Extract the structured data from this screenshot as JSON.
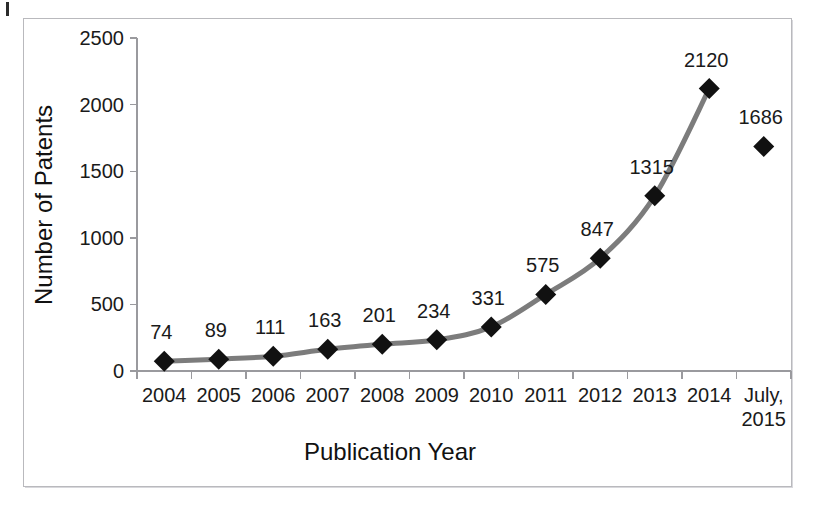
{
  "figure": {
    "background_color": "#ffffff",
    "frame_color": "#b9b9bd",
    "scan_mark_label": "scan-artifact"
  },
  "chart_data": {
    "type": "line",
    "title": "",
    "xlabel": "Publication Year",
    "ylabel": "Number of Patents",
    "categories": [
      "2004",
      "2005",
      "2006",
      "2007",
      "2008",
      "2009",
      "2010",
      "2011",
      "2012",
      "2013",
      "2014",
      "July,\n2015"
    ],
    "category_labels_display": [
      "2004",
      "2005",
      "2006",
      "2007",
      "2008",
      "2009",
      "2010",
      "2011",
      "2012",
      "2013",
      "2014",
      "July, 2015"
    ],
    "last_category_line1": "July,",
    "last_category_line2": "2015",
    "values": [
      74,
      89,
      111,
      163,
      201,
      234,
      331,
      575,
      847,
      1315,
      2120,
      1686
    ],
    "point_labels": [
      "74",
      "89",
      "111",
      "163",
      "201",
      "234",
      "331",
      "575",
      "847",
      "1315",
      "2120",
      "1686"
    ],
    "connected_points": 11,
    "disconnected_point_index": 11,
    "ylim": [
      0,
      2500
    ],
    "yticks": [
      0,
      500,
      1000,
      1500,
      2000,
      2500
    ],
    "ytick_labels": [
      "0",
      "500",
      "1000",
      "1500",
      "2000",
      "2500"
    ],
    "grid": false,
    "legend": false,
    "legend_position": "none",
    "line_color": "#7c7c7c",
    "marker_color": "#111111",
    "marker_shape": "diamond",
    "axis_color": "#9a9a9e"
  }
}
